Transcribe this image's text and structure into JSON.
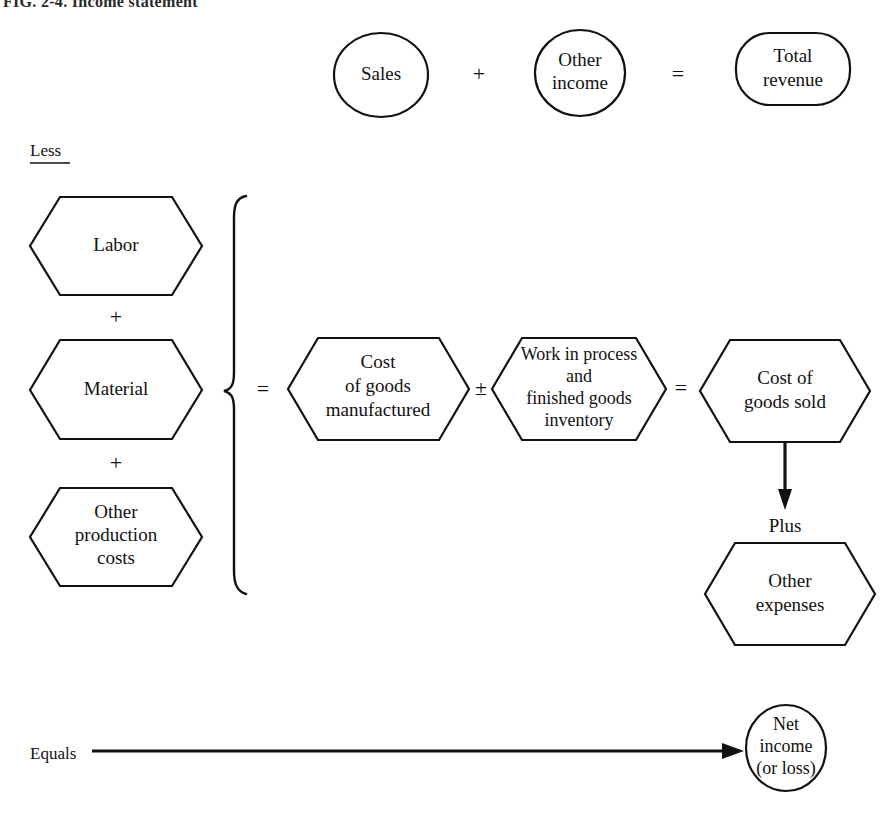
{
  "figure": {
    "title": "FIG. 2-4.  Income statement"
  },
  "revenue_row": {
    "sales": {
      "line1": "Sales"
    },
    "op1": "+",
    "other_income": {
      "line1": "Other",
      "line2": "income"
    },
    "op2": "=",
    "total_revenue": {
      "line1": "Total",
      "line2": "revenue"
    }
  },
  "less_label": "Less",
  "cost_inputs": {
    "labor": {
      "line1": "Labor"
    },
    "plus1": "+",
    "material": {
      "line1": "Material"
    },
    "plus2": "+",
    "other_production": {
      "line1": "Other",
      "line2": "production",
      "line3": "costs"
    }
  },
  "cogm_row": {
    "eq1": "=",
    "cost_of_goods_manufactured": {
      "line1": "Cost",
      "line2": "of goods",
      "line3": "manufactured"
    },
    "plusminus": "±",
    "wip_inventory": {
      "line1": "Work in process",
      "line2": "and",
      "line3": "finished goods",
      "line4": "inventory"
    },
    "eq2": "=",
    "cost_of_goods_sold": {
      "line1": "Cost of",
      "line2": "goods sold"
    }
  },
  "plus_label": "Plus",
  "other_expenses": {
    "line1": "Other",
    "line2": "expenses"
  },
  "bottom_row": {
    "equals_label": "Equals",
    "net_income": {
      "line1": "Net",
      "line2": "income",
      "line3": "(or loss)"
    }
  },
  "colors": {
    "ink": "#111111",
    "paper": "#ffffff"
  }
}
